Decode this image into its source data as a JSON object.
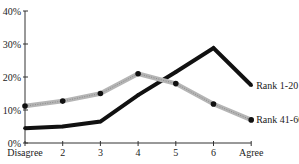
{
  "chart_data": {
    "type": "line",
    "title": "",
    "xlabel": "",
    "ylabel": "",
    "categories": [
      "Disagree",
      "2",
      "3",
      "4",
      "5",
      "6",
      "Agree"
    ],
    "y_ticks": [
      "0%",
      "10%",
      "20%",
      "30%",
      "40%"
    ],
    "ylim": [
      0,
      40
    ],
    "grid": false,
    "legend_position": "inline-right",
    "series": [
      {
        "name": "Rank 1-20",
        "color": "#111111",
        "values": [
          4.5,
          5.0,
          6.5,
          14.5,
          21.5,
          28.8,
          17.5
        ]
      },
      {
        "name": "Rank 41-60",
        "color": "#b5b5b5",
        "values": [
          11.2,
          12.7,
          15.0,
          21.0,
          18.0,
          11.8,
          7.0
        ]
      }
    ]
  }
}
